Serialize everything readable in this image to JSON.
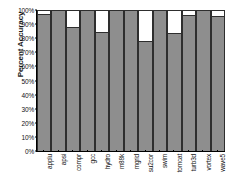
{
  "chart_data": {
    "type": "bar",
    "title": "",
    "xlabel": "",
    "ylabel": "Percent Accuracy",
    "ylim": [
      0,
      100
    ],
    "grid": false,
    "legend": "none",
    "units": "percent",
    "note": "Each gray bar is the measured accuracy; the white remainder above each bar extends to 100%.",
    "categories": [
      "applu",
      "apsi",
      "compr",
      "gcc",
      "hydro",
      "m88k",
      "mgrid",
      "su2cor",
      "swim",
      "tomcat",
      "turb3d",
      "vortex",
      "wave5"
    ],
    "values": [
      97.5,
      100,
      88,
      100,
      84.5,
      100,
      100,
      78,
      100,
      84,
      96.5,
      100,
      96
    ],
    "series": [
      {
        "name": "Percent Accuracy",
        "values": [
          97.5,
          100,
          88,
          100,
          84.5,
          100,
          100,
          78,
          100,
          84,
          96.5,
          100,
          96
        ]
      }
    ],
    "yticks": [
      0,
      10,
      20,
      30,
      40,
      50,
      60,
      70,
      80,
      90,
      100
    ],
    "ytick_labels": [
      "0%",
      "10%",
      "20%",
      "30%",
      "40%",
      "50%",
      "60%",
      "70%",
      "80%",
      "90%",
      "100%"
    ],
    "colors": {
      "bar_fill": "#8e8e8e",
      "bar_remainder": "#ffffff",
      "bar_outline": "#2e2e2e",
      "axis": "#000000",
      "text": "#111111"
    }
  }
}
